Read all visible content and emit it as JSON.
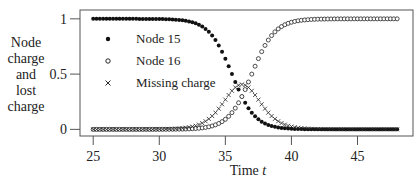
{
  "chart_data": {
    "type": "scatter",
    "title": "",
    "xlabel": "Time",
    "xlabel_var": "t",
    "ylabel_lines": [
      "Node",
      "charge",
      "and",
      "lost",
      "charge"
    ],
    "xlim": [
      24.0,
      49.2
    ],
    "ylim": [
      -0.06,
      1.08
    ],
    "xticks": [
      25,
      30,
      35,
      40,
      45
    ],
    "xtick_labels": [
      "25",
      "30",
      "35",
      "40",
      "45"
    ],
    "yticks": [
      0,
      0.5,
      1
    ],
    "ytick_labels": [
      "0",
      "0.5",
      "1"
    ],
    "grid": false,
    "legend_position": "upper-left",
    "x_range": [
      25,
      48
    ],
    "x_step": 0.25,
    "series": [
      {
        "name": "Node 15",
        "marker": "filled-circle",
        "model": "logistic-decreasing",
        "midpoint": 35.5,
        "rate": 1.15,
        "from": 1.0,
        "to": 0.0
      },
      {
        "name": "Node 16",
        "marker": "open-circle",
        "model": "logistic-increasing",
        "midpoint": 37.0,
        "rate": 1.15,
        "from": 0.0,
        "to": 1.0
      },
      {
        "name": "Missing charge",
        "marker": "cross",
        "model": "difference",
        "definition": "1 - Node 15 - Node 16",
        "peak_x": 36.2,
        "peak_y": 0.6
      }
    ]
  }
}
